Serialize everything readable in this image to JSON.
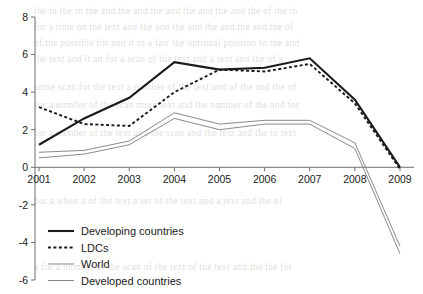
{
  "chart_data": {
    "type": "line",
    "title": "",
    "subtitle": "",
    "xlabel": "",
    "ylabel": "",
    "categories": [
      "2001",
      "2002",
      "2003",
      "2004",
      "2005",
      "2006",
      "2007",
      "2008",
      "2009"
    ],
    "x": [
      2001,
      2002,
      2003,
      2004,
      2005,
      2006,
      2007,
      2008,
      2009
    ],
    "xlim": [
      2001,
      2009
    ],
    "ylim": [
      -6,
      8
    ],
    "yticks": [
      8,
      6,
      4,
      2,
      0,
      -2,
      -4,
      -6
    ],
    "ytick_labels": [
      "8",
      "6",
      "4",
      "2",
      "0",
      "-2",
      "-4",
      "-6"
    ],
    "grid": false,
    "legend_position": "bottom-left",
    "zero_line": true,
    "series": [
      {
        "name": "Developing countries",
        "style": "solid-thick",
        "color": "#1a1a1a",
        "values": [
          1.2,
          2.6,
          3.7,
          5.6,
          5.2,
          5.3,
          5.8,
          3.6,
          0.0
        ]
      },
      {
        "name": "LDCs",
        "style": "dotted",
        "color": "#1a1a1a",
        "values": [
          3.2,
          2.3,
          2.2,
          4.0,
          5.2,
          5.1,
          5.5,
          3.4,
          -0.1
        ]
      },
      {
        "name": "World",
        "style": "solid-thin",
        "color": "#8a8a8a",
        "values": [
          0.8,
          0.9,
          1.4,
          2.9,
          2.3,
          2.5,
          2.5,
          1.3,
          -4.2
        ]
      },
      {
        "name": "Developed countries",
        "style": "solid-thin",
        "color": "#8a8a8a",
        "values": [
          0.5,
          0.7,
          1.2,
          2.6,
          2.0,
          2.3,
          2.3,
          1.0,
          -4.6
        ]
      }
    ]
  },
  "legend": {
    "items": [
      {
        "label": "Developing countries",
        "marker": "solid-thick-line-marker"
      },
      {
        "label": "LDCs",
        "marker": "dotted-line-marker"
      },
      {
        "label": "World",
        "marker": "thin-gray-line-marker"
      },
      {
        "label": "Developed countries",
        "marker": "thin-gray-line-marker"
      }
    ]
  },
  "colors": {
    "dark_series": "#1a1a1a",
    "gray_series": "#8a8a8a",
    "axis": "#6e6e6e",
    "background": "#ffffff"
  },
  "background_bleed": {
    "lines": [
      "the in the in the and the and the and the and the and the of the in",
      "for a time on the text and the and the and the and the and the of",
      "of the possible for and it to a fair the optional position to the and",
      "the text and it an for a scan of the text and a text and the of a",
      "some scan for the text a number of the text and of the and the of",
      "for a number of the scan more text and the number of the and for",
      "for a number of the text and the scan and the text and the to text",
      "but a when a of the text a set of the text and a text and the of",
      "a for a number of the scan of the text of the text and the the for"
    ]
  }
}
